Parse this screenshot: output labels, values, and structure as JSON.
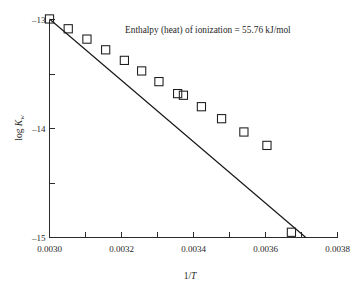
{
  "chart_data": {
    "type": "scatter",
    "title": "",
    "subtitle": "",
    "xlabel": "1/T",
    "ylabel": "log Kw",
    "ylabel_base": "log K",
    "ylabel_sub": "w",
    "xlim": [
      0.003,
      0.0038
    ],
    "ylim": [
      -15.0,
      -13.0
    ],
    "grid": false,
    "legend": "none",
    "x_major_ticks": [
      0.003,
      0.0032,
      0.0034,
      0.0036,
      0.0038
    ],
    "x_major_tick_labels": [
      "0.0030",
      "0.0032",
      "0.0034",
      "0.0036",
      "0.0038"
    ],
    "x_minor_ticks": [
      0.0031,
      0.0033,
      0.0035,
      0.0037
    ],
    "y_major_ticks": [
      -13,
      -14,
      -15
    ],
    "y_major_tick_labels": [
      "–13",
      "–14",
      "–15"
    ],
    "y_minor_ticks": [
      -13.5,
      -14.5
    ],
    "annotations": [
      {
        "text": "Enthalpy (heat) of ionization = 55.76 kJ/mol",
        "x": 0.00321,
        "y": -13.12
      }
    ],
    "series": [
      {
        "name": "log Kw vs 1/T",
        "marker": "open-square",
        "points": [
          {
            "x": 0.003,
            "y": -12.995
          },
          {
            "x": 0.003052,
            "y": -13.085
          },
          {
            "x": 0.003104,
            "y": -13.18
          },
          {
            "x": 0.003156,
            "y": -13.278
          },
          {
            "x": 0.003208,
            "y": -13.375
          },
          {
            "x": 0.003256,
            "y": -13.472
          },
          {
            "x": 0.003304,
            "y": -13.57
          },
          {
            "x": 0.003356,
            "y": -13.68
          },
          {
            "x": 0.003372,
            "y": -13.695
          },
          {
            "x": 0.003422,
            "y": -13.8
          },
          {
            "x": 0.003478,
            "y": -13.91
          },
          {
            "x": 0.00354,
            "y": -14.032
          },
          {
            "x": 0.003604,
            "y": -14.155
          },
          {
            "x": 0.003672,
            "y": -14.952
          }
        ]
      }
    ],
    "fit_line": {
      "x_start": 0.003,
      "y_start": -12.995,
      "x_end": 0.003712,
      "y_end": -15.0
    }
  }
}
